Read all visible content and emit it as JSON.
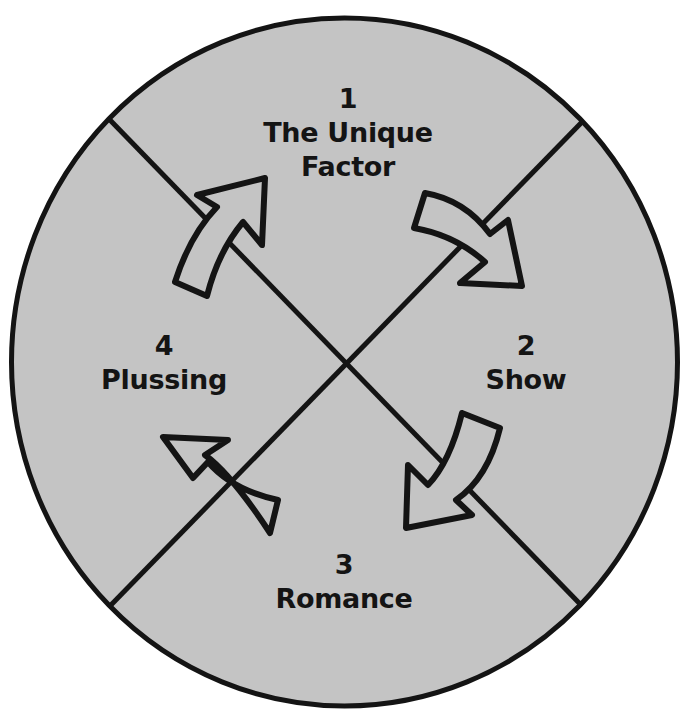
{
  "diagram": {
    "title": "",
    "colors": {
      "fill": "#c4c4c4",
      "stroke": "#141414",
      "background": "#ffffff"
    },
    "steps": [
      {
        "number": "1",
        "lines": [
          "The Unique",
          "Factor"
        ],
        "position": "top"
      },
      {
        "number": "2",
        "lines": [
          "Show"
        ],
        "position": "right"
      },
      {
        "number": "3",
        "lines": [
          "Romance"
        ],
        "position": "bottom"
      },
      {
        "number": "4",
        "lines": [
          "Plussing"
        ],
        "position": "left"
      }
    ],
    "arrows": [
      {
        "from": "4",
        "to": "1",
        "direction": "up-right"
      },
      {
        "from": "1",
        "to": "2",
        "direction": "down-right"
      },
      {
        "from": "2",
        "to": "3",
        "direction": "down-left"
      },
      {
        "from": "3",
        "to": "4",
        "direction": "up-left"
      }
    ]
  }
}
